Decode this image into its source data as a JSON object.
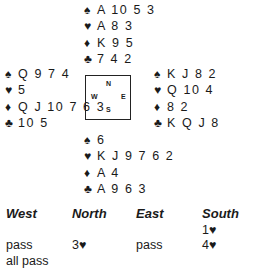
{
  "hands": {
    "north": [
      {
        "suit": "♠",
        "cards": "A 10 5 3"
      },
      {
        "suit": "♥",
        "cards": "A 8 3"
      },
      {
        "suit": "♦",
        "cards": "K 9 5"
      },
      {
        "suit": "♣",
        "cards": "7 4 2"
      }
    ],
    "west": [
      {
        "suit": "♠",
        "cards": "Q 9 7 4"
      },
      {
        "suit": "♥",
        "cards": "5"
      },
      {
        "suit": "♦",
        "cards": "Q J 10 7 6 3"
      },
      {
        "suit": "♣",
        "cards": "10 5"
      }
    ],
    "east": [
      {
        "suit": "♠",
        "cards": "K J 8 2"
      },
      {
        "suit": "♥",
        "cards": "Q 10 4"
      },
      {
        "suit": "♦",
        "cards": "8 2"
      },
      {
        "suit": "♣",
        "cards": "K Q J 8"
      }
    ],
    "south": [
      {
        "suit": "♠",
        "cards": "6"
      },
      {
        "suit": "♥",
        "cards": "K J 9 7 6 2"
      },
      {
        "suit": "♦",
        "cards": "A 4"
      },
      {
        "suit": "♣",
        "cards": "A 9 6 3"
      }
    ]
  },
  "compass": {
    "n": "N",
    "s": "S",
    "w": "W",
    "e": "E"
  },
  "bidding": {
    "headers": [
      "West",
      "North",
      "East",
      "South"
    ],
    "rows": [
      [
        "",
        "",
        "",
        "1♥"
      ],
      [
        "pass",
        "3♥",
        "pass",
        "4♥"
      ],
      [
        "all pass",
        "",
        "",
        ""
      ]
    ]
  }
}
